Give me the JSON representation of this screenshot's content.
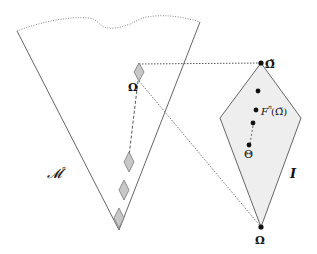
{
  "diagram": {
    "left_region_label": "𝓜",
    "left_region_superscript": "n",
    "left_omega_label": "Ω",
    "right_region_label": "I",
    "right_top_label": "Ω̃",
    "right_iter_label": "F",
    "right_iter_superscript": "n",
    "right_iter_arg": "(Ω̃)",
    "right_theta_label": "Θ",
    "right_bottom_label": "Ω",
    "colors": {
      "stroke": "#555555",
      "diamond_fill": "#c8c8c8",
      "region_fill": "#eeeeee",
      "dot": "#111111",
      "dashed": "#666666"
    }
  }
}
